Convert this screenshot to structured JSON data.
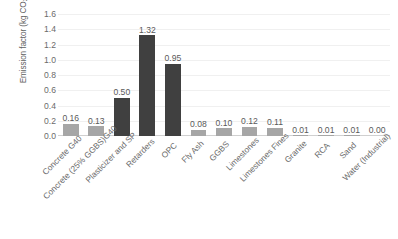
{
  "chart_data": {
    "type": "bar",
    "title": "",
    "xlabel": "",
    "ylabel": "Emission factor (kg CO2e q/kg)",
    "ylabel_parts": {
      "prefix": "Emission factor (kg CO",
      "sub": "2",
      "suffix": "e q/kg)"
    },
    "ylim": [
      0,
      1.6
    ],
    "ytick_labels": [
      "0.0",
      "0.2",
      "0.4",
      "0.6",
      "0.8",
      "1.0",
      "1.2",
      "1.4",
      "1.6"
    ],
    "ytick_values": [
      0.0,
      0.2,
      0.4,
      0.6,
      0.8,
      1.0,
      1.2,
      1.4,
      1.6
    ],
    "grid": true,
    "legend": "none",
    "categories": [
      "Concrete G40",
      "Concrete (25% GGBS)G40",
      "Plasticizer and SP",
      "Retarders",
      "OPC",
      "Fly Ash",
      "GGBS",
      "Limestones",
      "Limestones Fines",
      "Granite",
      "RCA",
      "Sand",
      "Water (Industrial)"
    ],
    "values": [
      0.16,
      0.13,
      0.5,
      1.32,
      0.95,
      0.08,
      0.1,
      0.12,
      0.11,
      0.01,
      0.01,
      0.01,
      0.0
    ],
    "value_labels": [
      "0.16",
      "0.13",
      "0.50",
      "1.32",
      "0.95",
      "0.08",
      "0.10",
      "0.12",
      "0.11",
      "0.01",
      "0.01",
      "0.01",
      "0.00"
    ],
    "bar_colors": [
      "#A6A6A6",
      "#A6A6A6",
      "#404040",
      "#404040",
      "#404040",
      "#A6A6A6",
      "#A6A6A6",
      "#A6A6A6",
      "#A6A6A6",
      "#A6A6A6",
      "#A6A6A6",
      "#A6A6A6",
      "#A6A6A6"
    ],
    "colors": {
      "light_bar": "#A6A6A6",
      "dark_bar": "#404040",
      "gridline": "#F0F0F0",
      "axis": "#D0D0D0",
      "text": "#6B6B6B",
      "background": "#FFFFFF"
    }
  }
}
